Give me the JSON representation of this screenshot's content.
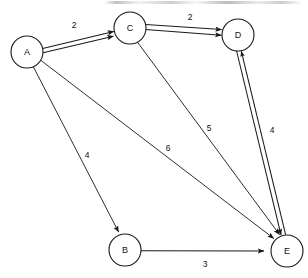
{
  "diagram": {
    "background_color": "#ffffff",
    "stroke_color": "#1a1a1a",
    "text_color": "#111111",
    "node_radius": 16,
    "nodes": [
      {
        "id": "A",
        "label": "A",
        "cx": 27,
        "cy": 52
      },
      {
        "id": "B",
        "label": "B",
        "cx": 125,
        "cy": 250
      },
      {
        "id": "C",
        "label": "C",
        "cx": 130,
        "cy": 28
      },
      {
        "id": "D",
        "label": "D",
        "cx": 238,
        "cy": 35
      },
      {
        "id": "E",
        "label": "E",
        "cx": 287,
        "cy": 251
      }
    ],
    "edges": [
      {
        "id": "a-c",
        "from": "A",
        "to": "C",
        "weight": "2",
        "label_x": 74,
        "label_y": 25,
        "style": "double",
        "directed": true
      },
      {
        "id": "c-d",
        "from": "C",
        "to": "D",
        "weight": "2",
        "label_x": 190,
        "label_y": 17,
        "style": "double",
        "directed": true
      },
      {
        "id": "a-b",
        "from": "A",
        "to": "B",
        "weight": "4",
        "label_x": 87,
        "label_y": 155,
        "style": "single",
        "directed": true
      },
      {
        "id": "a-e",
        "from": "A",
        "to": "E",
        "weight": "6",
        "label_x": 168,
        "label_y": 148,
        "style": "single",
        "directed": true
      },
      {
        "id": "c-e",
        "from": "C",
        "to": "E",
        "weight": "5",
        "label_x": 209,
        "label_y": 128,
        "style": "single",
        "directed": true
      },
      {
        "id": "d-e",
        "from": "D",
        "to": "E",
        "weight": "4",
        "label_x": 272,
        "label_y": 130,
        "style": "double",
        "directed": "both"
      },
      {
        "id": "b-e",
        "from": "B",
        "to": "E",
        "weight": "3",
        "label_x": 205,
        "label_y": 264,
        "style": "single",
        "directed": true
      }
    ]
  }
}
